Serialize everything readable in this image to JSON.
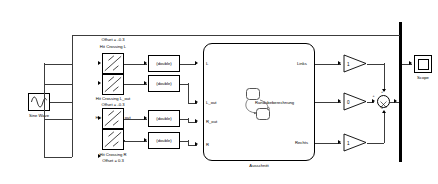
{
  "diagram": {
    "source": {
      "name": "sine-wave-source",
      "label": "Sine Wave",
      "icon": "sine-wave-icon"
    },
    "hit_crossing_blocks": [
      {
        "id": "hc-l",
        "label": "Hit Crossing L",
        "offset": "Offset = -0.3",
        "icon": "hit-crossing-icon"
      },
      {
        "id": "hc-l-out",
        "label": "Hit Crossing L_out",
        "offset": "Offset = -0.3",
        "icon": "hit-crossing-icon"
      },
      {
        "id": "hc-r-out",
        "label": "Hit Crossing R_out",
        "offset": "Offset = 0.3",
        "icon": "hit-crossing-icon"
      },
      {
        "id": "hc-r",
        "label": "Hit Crossing R",
        "offset": "Offset = 0.3",
        "icon": "hit-crossing-icon"
      }
    ],
    "converters": [
      {
        "id": "conv-1",
        "label": "(double)"
      },
      {
        "id": "conv-2",
        "label": "(double)"
      },
      {
        "id": "conv-3",
        "label": "(double)"
      },
      {
        "id": "conv-4",
        "label": "(double)"
      }
    ],
    "chart": {
      "name": "stateflow-chart",
      "label": "Ausschnitt",
      "inputs": [
        "L",
        "L_out",
        "R_out",
        "R"
      ],
      "outputs": [
        "Links",
        "Randabeberechnung",
        "Rechts"
      ],
      "states": [
        {
          "id": "state-a",
          "label": ""
        },
        {
          "id": "state-b",
          "label": ""
        }
      ]
    },
    "gains": [
      {
        "id": "gain-links",
        "value": "1"
      },
      {
        "id": "gain-middle",
        "value": "0"
      },
      {
        "id": "gain-rechts",
        "value": "1"
      }
    ],
    "sum": {
      "name": "sum-block",
      "signs": [
        "+",
        "+",
        "+"
      ]
    },
    "scope": {
      "name": "scope-block",
      "label": "Scope",
      "icon": "scope-icon"
    },
    "colors": {
      "line": "#3c3c3c",
      "border": "#000000",
      "background": "#ffffff",
      "bus": "#000000"
    }
  }
}
